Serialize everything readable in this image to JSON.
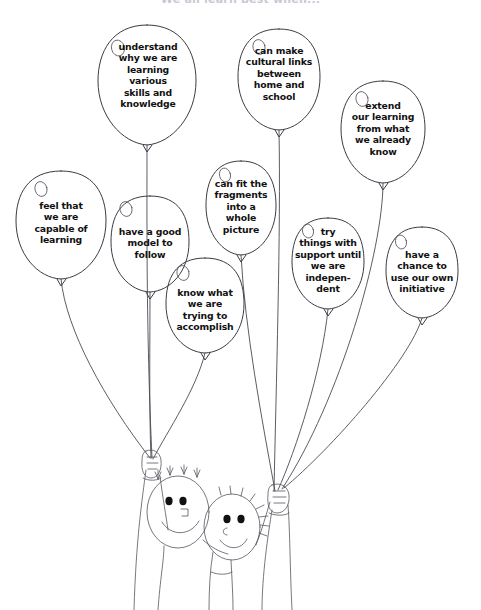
{
  "poster": {
    "title": "We all learn best when...",
    "title_color": "#c9c9d4",
    "ink_color": "#3b3b44",
    "background": "#ffffff",
    "width": 481,
    "height": 610
  },
  "balloons": [
    {
      "id": "understand-why",
      "text": "understand\nwhy we are\nlearning\nvarious\nskills and\nknowledge",
      "cx": 147,
      "cy": 85,
      "rx": 49,
      "ry": 60,
      "text_left": 103,
      "text_top": 41,
      "text_width": 90,
      "highlight_cx": 118,
      "highlight_cy": 48
    },
    {
      "id": "cultural-links",
      "text": "can make\ncultural links\nbetween\nhome and\nschool",
      "cx": 279,
      "cy": 79,
      "rx": 41,
      "ry": 51,
      "text_left": 236,
      "text_top": 45,
      "text_width": 86,
      "highlight_cx": 259,
      "highlight_cy": 47
    },
    {
      "id": "extend-learning",
      "text": "extend\nour learning\nfrom what\nwe already\nknow",
      "cx": 383,
      "cy": 131,
      "rx": 42,
      "ry": 52,
      "text_left": 340,
      "text_top": 100,
      "text_width": 86,
      "highlight_cx": 362,
      "highlight_cy": 99
    },
    {
      "id": "feel-capable",
      "text": "feel that\nwe are\ncapable of\nlearning",
      "cx": 61,
      "cy": 224,
      "rx": 45,
      "ry": 55,
      "text_left": 18,
      "text_top": 200,
      "text_width": 86,
      "highlight_cx": 41,
      "highlight_cy": 189
    },
    {
      "id": "good-model",
      "text": "have a good\nmodel to\nfollow",
      "cx": 150,
      "cy": 243,
      "rx": 39,
      "ry": 49,
      "text_left": 110,
      "text_top": 226,
      "text_width": 80,
      "highlight_cx": 126,
      "highlight_cy": 209
    },
    {
      "id": "fit-fragments",
      "text": "can fit the\nfragments\ninto a\nwhole\npicture",
      "cx": 241,
      "cy": 207,
      "rx": 35,
      "ry": 48,
      "text_left": 203,
      "text_top": 178,
      "text_width": 78,
      "highlight_cx": 225,
      "highlight_cy": 175
    },
    {
      "id": "try-with-support",
      "text": "try\nthings with\nsupport until\nwe are\nindepen-\ndent",
      "cx": 328,
      "cy": 263,
      "rx": 36,
      "ry": 46,
      "text_left": 291,
      "text_top": 226,
      "text_width": 74,
      "highlight_cx": 308,
      "highlight_cy": 228
    },
    {
      "id": "own-initiative",
      "text": "have a\nchance to\nuse our own\ninitiative",
      "cx": 422,
      "cy": 272,
      "rx": 36,
      "ry": 46,
      "text_left": 382,
      "text_top": 249,
      "text_width": 80,
      "highlight_cx": 401,
      "highlight_cy": 239
    },
    {
      "id": "know-what",
      "text": "know what\nwe are\ntrying to\naccomplish",
      "cx": 205,
      "cy": 305,
      "rx": 39,
      "ry": 48,
      "text_left": 163,
      "text_top": 287,
      "text_width": 84,
      "highlight_cx": 183,
      "highlight_cy": 273
    }
  ],
  "figures": [
    {
      "id": "child-left",
      "label": "child-with-tufty-hair"
    },
    {
      "id": "child-right",
      "label": "child-with-spiky-hair"
    }
  ],
  "hands": [
    {
      "id": "left-hand",
      "label": "hand-holding-balloon-strings",
      "x": 145,
      "y": 452
    },
    {
      "id": "right-hand",
      "label": "hand-holding-balloon-strings",
      "x": 272,
      "y": 485
    }
  ]
}
